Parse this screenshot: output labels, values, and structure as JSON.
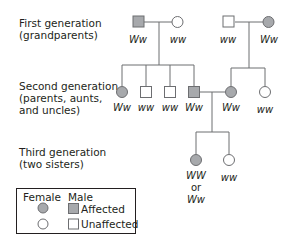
{
  "generation_labels": {
    "first": "First generation\n(grandparents)",
    "second": "Second generation\n(parents, aunts,\nand uncles)",
    "third": "Third generation\n(two sisters)"
  },
  "colors": {
    "affected_fill": "#a7a9ac",
    "unaffected_fill": "#ffffff",
    "line": "#6d6e71"
  },
  "generation1": {
    "left_couple": [
      {
        "sex": "male",
        "affected": true,
        "genotype": "Ww"
      },
      {
        "sex": "female",
        "affected": false,
        "genotype": "ww"
      }
    ],
    "right_couple": [
      {
        "sex": "male",
        "affected": false,
        "genotype": "ww"
      },
      {
        "sex": "female",
        "affected": true,
        "genotype": "Ww"
      }
    ]
  },
  "generation2": {
    "left_sibship": [
      {
        "sex": "female",
        "affected": true,
        "genotype": "Ww"
      },
      {
        "sex": "male",
        "affected": false,
        "genotype": "ww"
      },
      {
        "sex": "male",
        "affected": false,
        "genotype": "ww"
      },
      {
        "sex": "male",
        "affected": true,
        "genotype": "Ww"
      }
    ],
    "right_sibship": [
      {
        "sex": "female",
        "affected": true,
        "genotype": "Ww"
      },
      {
        "sex": "female",
        "affected": false,
        "genotype": "ww"
      }
    ]
  },
  "generation3": {
    "sisters": [
      {
        "sex": "female",
        "affected": true,
        "genotype_line1": "WW",
        "genotype_or": "or",
        "genotype_line2": "Ww"
      },
      {
        "sex": "female",
        "affected": false,
        "genotype": "ww"
      }
    ]
  },
  "legend": {
    "female_header": "Female",
    "male_header": "Male",
    "affected_label": "Affected",
    "unaffected_label": "Unaffected"
  }
}
